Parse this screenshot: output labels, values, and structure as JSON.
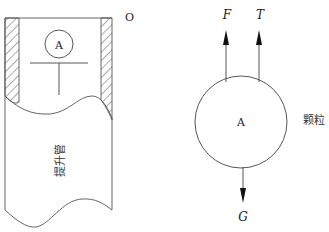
{
  "diagram": {
    "type": "free-body-diagram",
    "left_panel": {
      "pipe_label": "提升管",
      "corner_label": "O",
      "particle_label": "A"
    },
    "right_panel": {
      "particle_label": "A",
      "particle_caption": "颗粒",
      "forces": [
        {
          "symbol": "F",
          "direction": "up"
        },
        {
          "symbol": "T",
          "direction": "up"
        },
        {
          "symbol": "G",
          "direction": "down"
        }
      ]
    },
    "colors": {
      "stroke": "#333333",
      "text": "#222222",
      "background": "#ffffff"
    }
  }
}
